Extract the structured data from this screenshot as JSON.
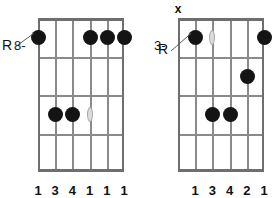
{
  "page": {
    "background_color": "#ffffff",
    "dot_color": "#141414",
    "grid_color": "#8a8a8a",
    "text_color": "#111111"
  },
  "diagrams": [
    {
      "id": "left",
      "name": "chord-diagram-left",
      "position_label": "8-",
      "root_label": "R",
      "root_string": 1,
      "string_count": 6,
      "fret_count": 4,
      "mutes": [],
      "dots": [
        {
          "string": 1,
          "fret": 1,
          "is_root": true
        },
        {
          "string": 4,
          "fret": 1,
          "is_root": false
        },
        {
          "string": 5,
          "fret": 1,
          "is_root": false
        },
        {
          "string": 6,
          "fret": 1,
          "is_root": false
        },
        {
          "string": 2,
          "fret": 3,
          "is_root": false
        },
        {
          "string": 3,
          "fret": 3,
          "is_root": false
        }
      ],
      "inlays": [
        {
          "string": 4,
          "fret": 1
        },
        {
          "string": 4,
          "fret": 3
        }
      ],
      "fingering": [
        {
          "string": 1,
          "label": "1"
        },
        {
          "string": 2,
          "label": "3"
        },
        {
          "string": 3,
          "label": "4"
        },
        {
          "string": 4,
          "label": "1"
        },
        {
          "string": 5,
          "label": "1"
        },
        {
          "string": 6,
          "label": "1"
        }
      ]
    },
    {
      "id": "right",
      "name": "chord-diagram-right",
      "position_label": "3-",
      "root_label": "R",
      "root_string": 2,
      "string_count": 6,
      "fret_count": 4,
      "mutes": [
        {
          "string": 1,
          "label": "x"
        }
      ],
      "dots": [
        {
          "string": 2,
          "fret": 1,
          "is_root": true
        },
        {
          "string": 6,
          "fret": 1,
          "is_root": false
        },
        {
          "string": 5,
          "fret": 2,
          "is_root": false
        },
        {
          "string": 3,
          "fret": 3,
          "is_root": false
        },
        {
          "string": 4,
          "fret": 3,
          "is_root": false
        }
      ],
      "inlays": [
        {
          "string": 3,
          "fret": 1
        }
      ],
      "fingering": [
        {
          "string": 2,
          "label": "1"
        },
        {
          "string": 3,
          "label": "3"
        },
        {
          "string": 4,
          "label": "4"
        },
        {
          "string": 5,
          "label": "2"
        },
        {
          "string": 6,
          "label": "1"
        }
      ]
    }
  ]
}
